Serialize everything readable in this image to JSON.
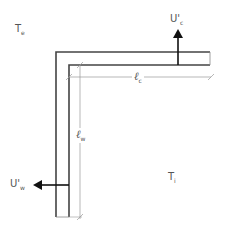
{
  "labels": {
    "te": {
      "main": "T",
      "sub": "e"
    },
    "ti": {
      "main": "T",
      "sub": "i"
    },
    "uc": {
      "main": "U",
      "prime": "'",
      "sub": "c"
    },
    "uw": {
      "main": "U",
      "prime": "'",
      "sub": "w"
    },
    "lc": {
      "main": "ℓ",
      "sub": "c"
    },
    "lw": {
      "main": "ℓ",
      "sub": "w"
    }
  },
  "colors": {
    "wall": "#444444",
    "dimension": "#999999",
    "arrow": "#111111",
    "text": "#555555"
  }
}
